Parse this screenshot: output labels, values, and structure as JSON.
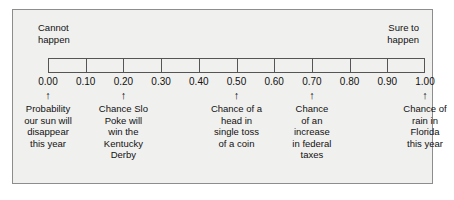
{
  "figure": {
    "kind": "probability-scale-number-line",
    "background": "#ffffff",
    "panel_fill": "#f0f0ee",
    "panel_border": "#8d8d8d",
    "bar_border": "#555555",
    "text_color": "#111111"
  },
  "captions": {
    "left": "Cannot\nhappen",
    "right": "Sure to\nhappen"
  },
  "scale": {
    "min": 0.0,
    "max": 1.0,
    "tick_values": [
      0.0,
      0.1,
      0.2,
      0.3,
      0.4,
      0.5,
      0.6,
      0.7,
      0.8,
      0.9,
      1.0
    ],
    "tick_labels": [
      "0.00",
      "0.10",
      "0.20",
      "0.30",
      "0.40",
      "0.50",
      "0.60",
      "0.70",
      "0.80",
      "0.90",
      "1.00"
    ]
  },
  "arrow_glyph": "↑",
  "annotations": [
    {
      "value": 0.0,
      "label": "Probability\nour sun will\ndisappear\nthis year"
    },
    {
      "value": 0.2,
      "label": "Chance Slo\nPoke will\nwin the\nKentucky\nDerby"
    },
    {
      "value": 0.5,
      "label": "Chance of a\nhead in\nsingle toss\nof a coin"
    },
    {
      "value": 0.7,
      "label": "Chance\nof an\nincrease\nin federal\ntaxes"
    },
    {
      "value": 1.0,
      "label": "Chance of\nrain in\nFlorida\nthis year"
    }
  ],
  "chart_data": {
    "type": "line",
    "title": "",
    "xlabel": "",
    "ylabel": "",
    "xlim": [
      0.0,
      1.0
    ],
    "grid": false,
    "legend": "none",
    "categories": [
      "0.00",
      "0.10",
      "0.20",
      "0.30",
      "0.40",
      "0.50",
      "0.60",
      "0.70",
      "0.80",
      "0.90",
      "1.00"
    ],
    "values": [
      0.0,
      0.1,
      0.2,
      0.3,
      0.4,
      0.5,
      0.6,
      0.7,
      0.8,
      0.9,
      1.0
    ],
    "annotations": [
      {
        "x": 0.0,
        "text": "Probability our sun will disappear this year"
      },
      {
        "x": 0.2,
        "text": "Chance Slo Poke will win the Kentucky Derby"
      },
      {
        "x": 0.5,
        "text": "Chance of a head in single toss of a coin"
      },
      {
        "x": 0.7,
        "text": "Chance of an increase in federal taxes"
      },
      {
        "x": 1.0,
        "text": "Chance of rain in Florida this year"
      }
    ],
    "endpoint_labels": {
      "left": "Cannot happen",
      "right": "Sure to happen"
    }
  }
}
